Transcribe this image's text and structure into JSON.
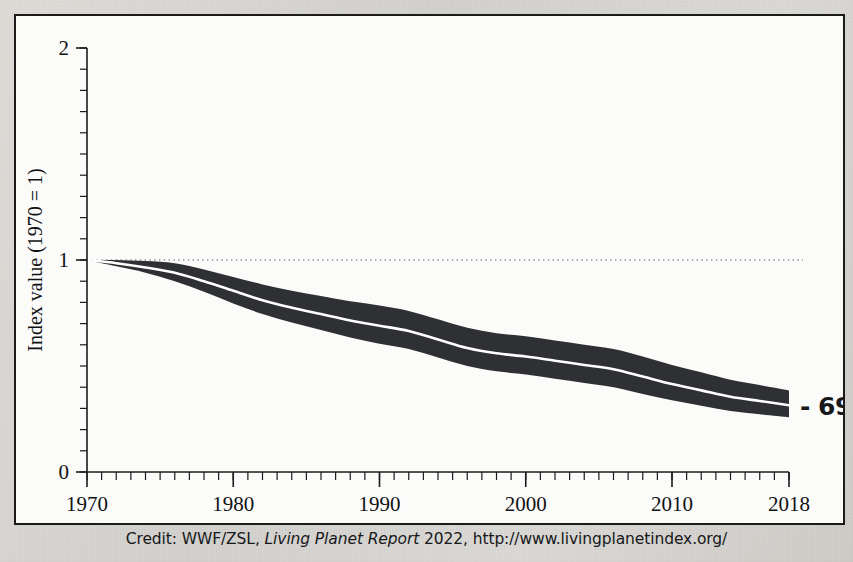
{
  "chart_data": {
    "type": "area",
    "title": "",
    "subtitle": "",
    "xlabel": "",
    "ylabel": "Index value (1970 = 1)",
    "xlim": [
      1970,
      2018
    ],
    "ylim": [
      0,
      2
    ],
    "grid": false,
    "legend": null,
    "y_ticks": [
      "0",
      "1",
      "2"
    ],
    "y_tick_values": [
      0,
      1,
      2
    ],
    "y_minor_tick_step": 0.1,
    "x_ticks": [
      "1970",
      "1980",
      "1990",
      "2000",
      "2010",
      "2018"
    ],
    "x_tick_values": [
      1970,
      1980,
      1990,
      2000,
      2010,
      2018
    ],
    "x_minor_tick_step": 1,
    "reference_line": {
      "value": 1,
      "style": "dotted",
      "color": "#8d9096"
    },
    "annotation": {
      "text": "- 69%",
      "x": 2018,
      "y": 0.31
    },
    "band_color": "#2e3033",
    "centerline_color": "#ffffff",
    "series": [
      {
        "name": "Living Planet Index (mean)",
        "x": [
          1970,
          1972,
          1974,
          1976,
          1978,
          1980,
          1982,
          1984,
          1986,
          1988,
          1990,
          1992,
          1994,
          1996,
          1998,
          2000,
          2002,
          2004,
          2006,
          2008,
          2010,
          2012,
          2014,
          2016,
          2018
        ],
        "values": [
          1.0,
          0.985,
          0.965,
          0.94,
          0.9,
          0.855,
          0.81,
          0.775,
          0.745,
          0.715,
          0.69,
          0.665,
          0.625,
          0.585,
          0.56,
          0.545,
          0.525,
          0.505,
          0.485,
          0.45,
          0.415,
          0.385,
          0.355,
          0.335,
          0.315
        ]
      },
      {
        "name": "Living Planet Index (upper confidence limit)",
        "x": [
          1970,
          1972,
          1974,
          1976,
          1978,
          1980,
          1982,
          1984,
          1986,
          1988,
          1990,
          1992,
          1994,
          1996,
          1998,
          2000,
          2002,
          2004,
          2006,
          2008,
          2010,
          2012,
          2014,
          2016,
          2018
        ],
        "values": [
          1.0,
          1.0,
          0.995,
          0.985,
          0.955,
          0.92,
          0.885,
          0.855,
          0.83,
          0.805,
          0.785,
          0.76,
          0.72,
          0.68,
          0.655,
          0.64,
          0.62,
          0.6,
          0.58,
          0.545,
          0.505,
          0.47,
          0.435,
          0.41,
          0.385
        ]
      },
      {
        "name": "Living Planet Index (lower confidence limit)",
        "x": [
          1970,
          1972,
          1974,
          1976,
          1978,
          1980,
          1982,
          1984,
          1986,
          1988,
          1990,
          1992,
          1994,
          1996,
          1998,
          2000,
          2002,
          2004,
          2006,
          2008,
          2010,
          2012,
          2014,
          2016,
          2018
        ],
        "values": [
          1.0,
          0.97,
          0.94,
          0.9,
          0.85,
          0.795,
          0.745,
          0.705,
          0.67,
          0.635,
          0.605,
          0.58,
          0.54,
          0.5,
          0.475,
          0.46,
          0.44,
          0.42,
          0.4,
          0.368,
          0.338,
          0.312,
          0.288,
          0.272,
          0.258
        ]
      }
    ]
  },
  "credit": {
    "prefix": "Credit: WWF/ZSL, ",
    "italic_part": "Living Planet Report",
    "suffix": " 2022, http://www.livingplanetindex.org/"
  }
}
